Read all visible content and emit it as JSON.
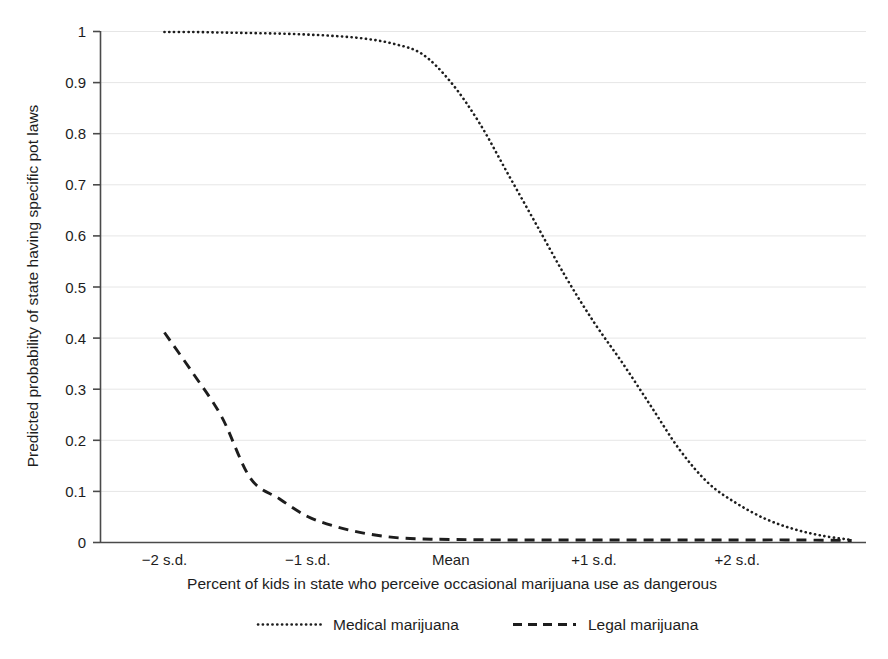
{
  "chart_data": {
    "type": "line",
    "title": "",
    "xlabel": "Percent of kids in state who perceive occasional marijuana use as dangerous",
    "ylabel": "Predicted probability of state having specific pot laws",
    "xlim": [
      -2.45,
      2.9
    ],
    "ylim": [
      0,
      1
    ],
    "grid": true,
    "grid_axis": "y",
    "legend_position": "bottom-center",
    "x_tick_labels": [
      "−2 s.d.",
      "−1 s.d.",
      "Mean",
      "+1 s.d.",
      "+2 s.d."
    ],
    "x_tick_values": [
      -2,
      -1,
      0,
      1,
      2
    ],
    "y_tick_labels": [
      "0",
      "0.1",
      "0.2",
      "0.3",
      "0.4",
      "0.5",
      "0.6",
      "0.7",
      "0.8",
      "0.9",
      "1"
    ],
    "y_tick_values": [
      0,
      0.1,
      0.2,
      0.3,
      0.4,
      0.5,
      0.6,
      0.7,
      0.8,
      0.9,
      1
    ],
    "series": [
      {
        "name": "Medical marijuana",
        "style": "dotted",
        "color": "#1d1d1d",
        "x": [
          -2.0,
          -1.8,
          -1.6,
          -1.4,
          -1.2,
          -1.0,
          -0.8,
          -0.6,
          -0.4,
          -0.2,
          0.0,
          0.2,
          0.4,
          0.6,
          0.8,
          1.0,
          1.2,
          1.4,
          1.6,
          1.8,
          2.0,
          2.2,
          2.4,
          2.6,
          2.8
        ],
        "values": [
          0.998,
          0.998,
          0.997,
          0.996,
          0.995,
          0.993,
          0.99,
          0.985,
          0.975,
          0.955,
          0.9,
          0.82,
          0.72,
          0.62,
          0.52,
          0.43,
          0.35,
          0.265,
          0.18,
          0.115,
          0.075,
          0.045,
          0.025,
          0.012,
          0.004
        ]
      },
      {
        "name": "Legal marijuana",
        "style": "dashed",
        "color": "#1d1d1d",
        "x": [
          -2.0,
          -1.8,
          -1.6,
          -1.4,
          -1.2,
          -1.0,
          -0.8,
          -0.6,
          -0.4,
          -0.2,
          0.0,
          0.4,
          0.8,
          1.2,
          1.6,
          2.0,
          2.4,
          2.8
        ],
        "values": [
          0.41,
          0.33,
          0.245,
          0.125,
          0.085,
          0.05,
          0.03,
          0.017,
          0.009,
          0.006,
          0.005,
          0.004,
          0.004,
          0.004,
          0.004,
          0.004,
          0.004,
          0.003
        ]
      }
    ]
  },
  "legend": {
    "items": [
      {
        "label": "Medical marijuana",
        "style": "dotted"
      },
      {
        "label": "Legal marijuana",
        "style": "dashed"
      }
    ]
  },
  "axes": {
    "y_title": "Predicted probability of state having specific pot laws",
    "x_title": "Percent of kids in state who perceive occasional marijuana use as dangerous"
  },
  "colors": {
    "ink": "#1d1d1d",
    "gridline": "#e6e6e6",
    "axis": "#4a4a4a",
    "background": "#ffffff"
  }
}
